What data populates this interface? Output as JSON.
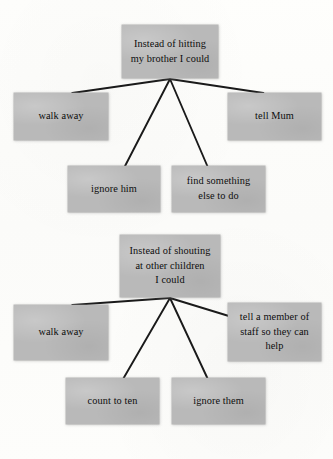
{
  "page": {
    "background_color": "#fdfdfb",
    "box_fill_color": "#b9b9b9",
    "line_color": "#1a1a1a",
    "text_color": "#0d0d0d"
  },
  "diagrams": [
    {
      "name": "hitting-my-brother",
      "root": {
        "text": "Instead of hitting\nmy brother I could",
        "x": 122,
        "y": 25,
        "w": 96,
        "h": 53
      },
      "options": [
        {
          "name": "walk-away",
          "text": "walk away",
          "x": 14,
          "y": 93,
          "w": 94,
          "h": 47
        },
        {
          "name": "tell-mum",
          "text": "tell Mum",
          "x": 228,
          "y": 93,
          "w": 93,
          "h": 47
        },
        {
          "name": "ignore-him",
          "text": "ignore him",
          "x": 68,
          "y": 166,
          "w": 92,
          "h": 46
        },
        {
          "name": "find-something-else",
          "text": "find something\nelse to do",
          "x": 172,
          "y": 166,
          "w": 93,
          "h": 46
        }
      ],
      "hub": {
        "x": 170,
        "y": 79
      }
    },
    {
      "name": "shouting-at-other-children",
      "root": {
        "text": "Instead of shouting\nat other children\nI could",
        "x": 120,
        "y": 235,
        "w": 100,
        "h": 62
      },
      "options": [
        {
          "name": "walk-away",
          "text": "walk away",
          "x": 14,
          "y": 305,
          "w": 94,
          "h": 55
        },
        {
          "name": "tell-a-member-of-staff",
          "text": "tell a member of\nstaff so they can\nhelp",
          "x": 228,
          "y": 303,
          "w": 93,
          "h": 58
        },
        {
          "name": "count-to-ten",
          "text": "count to ten",
          "x": 66,
          "y": 378,
          "w": 93,
          "h": 46
        },
        {
          "name": "ignore-them",
          "text": "ignore them",
          "x": 172,
          "y": 378,
          "w": 93,
          "h": 46
        }
      ],
      "hub": {
        "x": 170,
        "y": 298
      }
    }
  ]
}
